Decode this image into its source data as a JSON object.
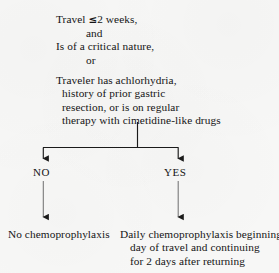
{
  "diagram": {
    "type": "flowchart",
    "title_visible": false,
    "background_color": "#f7f7f6",
    "ink_color": "#1a1a1a",
    "nodes": {
      "criteria_top": {
        "lines": [
          "Travel ≤2 weeks,",
          "and",
          "Is of a critical nature,",
          "or"
        ]
      },
      "criteria_mid": {
        "lines": [
          "Traveler has achlorhydria,",
          "history of prior gastric",
          "resection, or is on regular",
          "therapy with cimetidine-like drugs"
        ]
      },
      "outcome_no": {
        "lines": [
          "No chemoprophylaxis"
        ]
      },
      "outcome_yes": {
        "lines": [
          "Daily chemoprophylaxis beginning",
          "day of travel and continuing",
          "for 2 days after returning"
        ]
      }
    },
    "branches": [
      {
        "id": "no",
        "label": "NO"
      },
      {
        "id": "yes",
        "label": "YES"
      }
    ]
  }
}
